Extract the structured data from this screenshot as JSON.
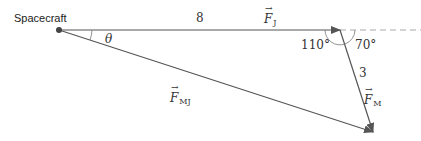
{
  "diagram": {
    "labels": {
      "spacecraft": "Spacecraft",
      "theta": "θ",
      "fj_magnitude": "8",
      "fj_symbol": "F",
      "fj_subscript": "J",
      "fm_magnitude": "3",
      "fm_symbol": "F",
      "fm_subscript": "M",
      "fmj_symbol": "F",
      "fmj_subscript": "MJ",
      "angle_interior": "110°",
      "angle_exterior": "70°"
    },
    "colors": {
      "line": "#555555",
      "dashed": "#aaaaaa",
      "text": "#333333"
    }
  }
}
